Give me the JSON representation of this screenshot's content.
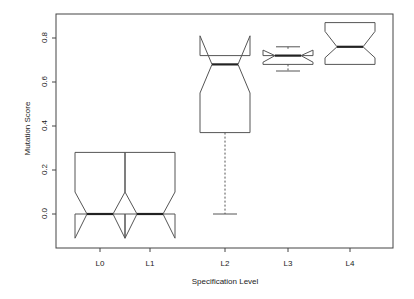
{
  "chart_data": {
    "type": "boxplot",
    "notched": true,
    "title": "",
    "xlabel": "Specification Level",
    "ylabel": "Mutation Score",
    "categories": [
      "L0",
      "L1",
      "L2",
      "L3",
      "L4"
    ],
    "yticks": [
      "0.0",
      "0.2",
      "0.4",
      "0.6",
      "0.8"
    ],
    "ytick_values": [
      0.0,
      0.2,
      0.4,
      0.6,
      0.8
    ],
    "ylim": [
      -0.15,
      0.92
    ],
    "grid": false,
    "legend": null,
    "series": [
      {
        "name": "L0",
        "min": 0.0,
        "q1": 0.0,
        "median": 0.0,
        "q3": 0.28,
        "max": 0.28,
        "notch_low": -0.11,
        "notch_high": 0.1
      },
      {
        "name": "L1",
        "min": 0.0,
        "q1": 0.0,
        "median": 0.0,
        "q3": 0.28,
        "max": 0.28,
        "notch_low": -0.11,
        "notch_high": 0.1
      },
      {
        "name": "L2",
        "min": 0.0,
        "q1": 0.37,
        "median": 0.68,
        "q3": 0.72,
        "max": 0.72,
        "notch_low": 0.55,
        "notch_high": 0.81
      },
      {
        "name": "L3",
        "min": 0.65,
        "q1": 0.68,
        "median": 0.72,
        "q3": 0.72,
        "max": 0.76,
        "notch_low": 0.69,
        "notch_high": 0.745
      },
      {
        "name": "L4",
        "min": 0.68,
        "q1": 0.68,
        "median": 0.76,
        "q3": 0.87,
        "max": 0.87,
        "notch_low": 0.71,
        "notch_high": 0.83
      }
    ]
  },
  "colors": {
    "line": "#555555",
    "median": "#222222",
    "axis": "#444444"
  }
}
